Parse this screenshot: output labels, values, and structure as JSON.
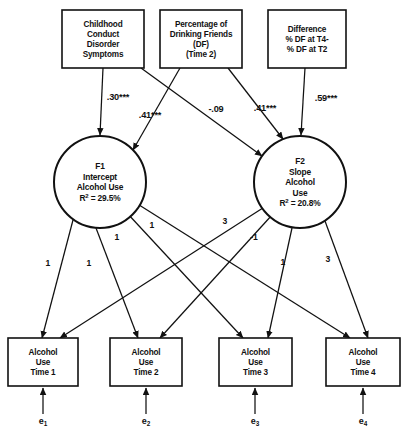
{
  "figure": {
    "type": "path-diagram",
    "title": "",
    "background_color": "#ffffff",
    "line_color": "#111111"
  },
  "exogenous_boxes": [
    {
      "id": "childhood-conduct",
      "lines": [
        "Childhood",
        "Conduct",
        "Disorder",
        "Symptoms"
      ],
      "x": 62,
      "y": 10,
      "w": 82,
      "h": 58
    },
    {
      "id": "drinking-friends",
      "lines": [
        "Percentage of",
        "Drinking Friends",
        "(DF)",
        "(Time 2)"
      ],
      "x": 160,
      "y": 10,
      "w": 82,
      "h": 58
    },
    {
      "id": "difference-df",
      "lines": [
        "Difference",
        "% DF at T4-",
        "% DF at T2"
      ],
      "x": 268,
      "y": 10,
      "w": 78,
      "h": 58
    }
  ],
  "latent_factors": [
    {
      "id": "f1-intercept",
      "label": "F1",
      "lines": [
        "F1",
        "Intercept",
        "Alcohol Use",
        "R² = 29.5%"
      ],
      "r_squared": "29.5%",
      "cx": 100,
      "cy": 182,
      "r": 46
    },
    {
      "id": "f2-slope",
      "label": "F2",
      "lines": [
        "F2",
        "Slope",
        "Alcohol",
        "Use",
        "R² = 20.8%"
      ],
      "r_squared": "20.8%",
      "cx": 300,
      "cy": 182,
      "r": 46
    }
  ],
  "indicator_boxes": [
    {
      "id": "alcohol-use-t1",
      "lines": [
        "Alcohol",
        "Use",
        "Time 1"
      ],
      "x": 8,
      "y": 338,
      "w": 70,
      "h": 48
    },
    {
      "id": "alcohol-use-t2",
      "lines": [
        "Alcohol",
        "Use",
        "Time 2"
      ],
      "x": 110,
      "y": 338,
      "w": 72,
      "h": 48
    },
    {
      "id": "alcohol-use-t3",
      "lines": [
        "Alcohol",
        "Use",
        "Time 3"
      ],
      "x": 219,
      "y": 338,
      "w": 73,
      "h": 48
    },
    {
      "id": "alcohol-use-t4",
      "lines": [
        "Alcohol",
        "Use",
        "Time 4"
      ],
      "x": 326,
      "y": 338,
      "w": 74,
      "h": 48
    }
  ],
  "error_terms": [
    {
      "id": "e1",
      "symbol": "e",
      "subscript": "1",
      "x": 43,
      "y": 424
    },
    {
      "id": "e2",
      "symbol": "e",
      "subscript": "2",
      "x": 146,
      "y": 424
    },
    {
      "id": "e3",
      "symbol": "e",
      "subscript": "3",
      "x": 255,
      "y": 424
    },
    {
      "id": "e4",
      "symbol": "e",
      "subscript": "4",
      "x": 363,
      "y": 424
    }
  ],
  "structural_paths": [
    {
      "id": "conduct-to-f1",
      "from": "childhood-conduct",
      "to": "f1-intercept",
      "coefficient": ".30***",
      "label_x": 118,
      "label_y": 100,
      "x1": 103,
      "y1": 68,
      "x2": 100,
      "y2": 135
    },
    {
      "id": "drinkfriends-to-f1",
      "from": "drinking-friends",
      "to": "f1-intercept",
      "coefficient": ".41***",
      "label_x": 150,
      "label_y": 118,
      "x1": 180,
      "y1": 68,
      "x2": 133,
      "y2": 150
    },
    {
      "id": "conduct-to-f2",
      "from": "childhood-conduct",
      "to": "f2-slope",
      "coefficient": "-.09",
      "label_x": 216,
      "label_y": 112,
      "x1": 141,
      "y1": 68,
      "x2": 262,
      "y2": 156
    },
    {
      "id": "drinkfriends-to-f2",
      "from": "drinking-friends",
      "to": "f2-slope",
      "coefficient": ".41***",
      "label_x": 265,
      "label_y": 111,
      "x1": 228,
      "y1": 68,
      "x2": 283,
      "y2": 139
    },
    {
      "id": "difference-to-f2",
      "from": "difference-df",
      "to": "f2-slope",
      "coefficient": ".59***",
      "label_x": 326,
      "label_y": 101,
      "x1": 305,
      "y1": 68,
      "x2": 301,
      "y2": 135
    }
  ],
  "loadings_f1": [
    {
      "id": "f1-to-t1",
      "to": "alcohol-use-t1",
      "value": "1",
      "label_x": 48,
      "label_y": 266,
      "x1": 73,
      "y1": 220,
      "x2": 42,
      "y2": 338
    },
    {
      "id": "f1-to-t2",
      "to": "alcohol-use-t2",
      "value": "1",
      "label_x": 89,
      "label_y": 266,
      "x1": 96,
      "y1": 228,
      "x2": 138,
      "y2": 338
    },
    {
      "id": "f1-to-t3",
      "to": "alcohol-use-t3",
      "value": "1",
      "label_x": 117,
      "label_y": 240,
      "x1": 127,
      "y1": 213,
      "x2": 243,
      "y2": 338
    },
    {
      "id": "f1-to-t4",
      "to": "alcohol-use-t4",
      "value": "1",
      "label_x": 152,
      "label_y": 228,
      "x1": 136,
      "y1": 203,
      "x2": 350,
      "y2": 338
    }
  ],
  "loadings_f2": [
    {
      "id": "f2-to-t1",
      "to": "alcohol-use-t1",
      "value": "3",
      "label_x": 225,
      "label_y": 224,
      "x1": 266,
      "y1": 206,
      "x2": 60,
      "y2": 338
    },
    {
      "id": "f2-to-t2",
      "to": "alcohol-use-t2",
      "value": "-1",
      "label_x": 254,
      "label_y": 240,
      "x1": 272,
      "y1": 215,
      "x2": 160,
      "y2": 338
    },
    {
      "id": "f2-to-t3",
      "to": "alcohol-use-t3",
      "value": "1",
      "label_x": 283,
      "label_y": 265,
      "x1": 292,
      "y1": 228,
      "x2": 268,
      "y2": 338
    },
    {
      "id": "f2-to-t4",
      "to": "alcohol-use-t4",
      "value": "3",
      "label_x": 328,
      "label_y": 262,
      "x1": 325,
      "y1": 221,
      "x2": 368,
      "y2": 338
    }
  ],
  "error_paths": [
    {
      "id": "e1-to-t1",
      "x1": 43,
      "y1": 414,
      "x2": 43,
      "y2": 388
    },
    {
      "id": "e2-to-t2",
      "x1": 146,
      "y1": 414,
      "x2": 146,
      "y2": 388
    },
    {
      "id": "e3-to-t3",
      "x1": 255,
      "y1": 414,
      "x2": 255,
      "y2": 388
    },
    {
      "id": "e4-to-t4",
      "x1": 363,
      "y1": 414,
      "x2": 363,
      "y2": 388
    }
  ]
}
